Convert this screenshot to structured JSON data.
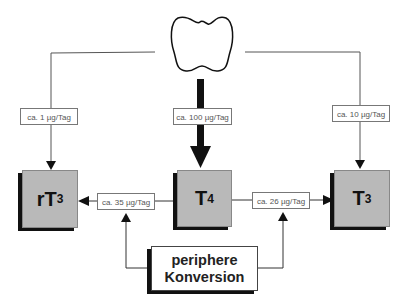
{
  "diagram": {
    "source_organ": "thyroid-gland",
    "hormones": {
      "rt3": {
        "main": "rT",
        "sub": "3"
      },
      "t4": {
        "main": "T",
        "sub": "4"
      },
      "t3": {
        "main": "T",
        "sub": "3"
      }
    },
    "rates": {
      "thyroid_to_rt3": "ca. 1 µg/Tag",
      "thyroid_to_t4": "ca. 100 µg/Tag",
      "thyroid_to_t3": "ca. 10 µg/Tag",
      "t4_to_rt3": "ca. 35 µg/Tag",
      "t4_to_t3": "ca. 26 µg/Tag"
    },
    "conversion": {
      "line1": "periphere",
      "line2": "Konversion"
    },
    "colors": {
      "box_fill": "#b9b9b9",
      "shadow": "#111111",
      "line": "#555555"
    }
  }
}
